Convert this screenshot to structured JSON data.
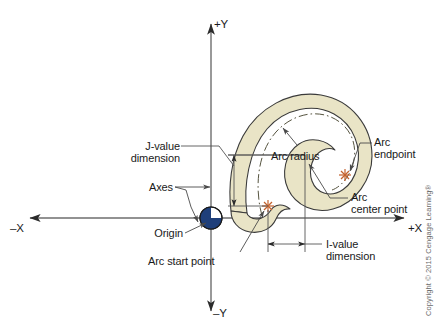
{
  "figure": {
    "background_color": "#ffffff"
  },
  "axes": {
    "x_positive_label": "+X",
    "x_negative_label": "–X",
    "y_positive_label": "+Y",
    "y_negative_label": "–Y",
    "line_color": "#6e6e6e",
    "origin_x": 211,
    "origin_y": 218
  },
  "labels": {
    "j_value_line1": "J-value",
    "j_value_line2": "dimension",
    "axes": "Axes",
    "origin": "Origin",
    "arc_radius": "Arc radius",
    "arc_endpoint_line1": "Arc",
    "arc_endpoint_line2": "endpoint",
    "arc_center_line1": "Arc",
    "arc_center_line2": "center point",
    "i_value_line1": "I-value",
    "i_value_line2": "dimension",
    "arc_start": "Arc start point"
  },
  "shape": {
    "name": "horseshoe-arc-part",
    "fill_color": "#e9e4c6",
    "outline_color": "#3a3a3a",
    "centerline_color": "#4a4a3a",
    "centerline_style": "dash-dot"
  },
  "markers": {
    "origin_symbol": "quartered-circle-datum",
    "origin_fill": "#1f3f7a",
    "point_marker_color": "#c4622d",
    "arc_start_point": {
      "x": 268,
      "y": 206
    },
    "arc_center_point": {
      "x": 303,
      "y": 155
    },
    "arc_end_point": {
      "x": 345,
      "y": 175
    }
  },
  "copyright": "Copyright © 2015 Cengage Learning®"
}
